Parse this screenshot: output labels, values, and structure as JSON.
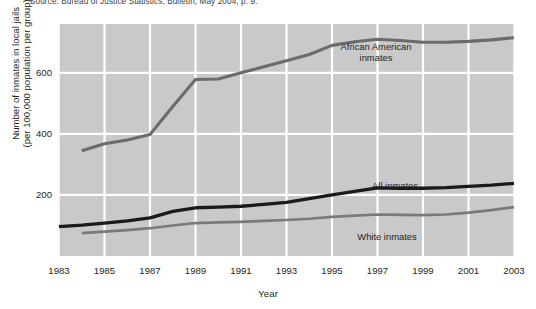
{
  "figure": {
    "source_note": "Source: Bureau of Justice Statistics, Bulletin, May 2004, p. 9.",
    "xaxis_title": "Year",
    "yaxis_title_line1": "Number of inmates in local jails",
    "yaxis_title_line2": "(per 100,000 population per group)",
    "annotations": {
      "african_american_line1": "African American",
      "african_american_line2": "inmates",
      "all_inmates": "All inmates",
      "white_inmates": "White inmates"
    }
  },
  "colors": {
    "plot_background": "#c9c9c9",
    "gridline": "#ffffff",
    "page_background": "#ffffff",
    "african_american_line": "#6b6b6b",
    "all_inmates_line": "#1a1a1a",
    "white_inmates_line": "#7a7a7a",
    "text": "#231f20"
  },
  "chart_data": {
    "type": "line",
    "title": "",
    "xlabel": "Year",
    "ylabel": "Number of inmates in local jails (per 100,000 population per group)",
    "xlim": [
      1983,
      2003
    ],
    "ylim": [
      0,
      760
    ],
    "xticks": [
      1983,
      1985,
      1987,
      1989,
      1991,
      1993,
      1995,
      1997,
      1999,
      2001,
      2003
    ],
    "yticks": [
      200,
      400,
      600
    ],
    "grid": true,
    "legend_position": "inline-annotations",
    "x": [
      1983,
      1984,
      1985,
      1986,
      1987,
      1988,
      1989,
      1990,
      1991,
      1992,
      1993,
      1994,
      1995,
      1996,
      1997,
      1998,
      1999,
      2000,
      2001,
      2002,
      2003
    ],
    "series": [
      {
        "name": "African American inmates",
        "color": "#6b6b6b",
        "values": [
          null,
          345,
          368,
          380,
          398,
          490,
          578,
          580,
          600,
          620,
          640,
          660,
          690,
          702,
          710,
          706,
          700,
          700,
          703,
          708,
          715
        ]
      },
      {
        "name": "All inmates",
        "color": "#1a1a1a",
        "values": [
          96,
          101,
          108,
          115,
          125,
          146,
          158,
          160,
          163,
          169,
          176,
          188,
          200,
          212,
          223,
          222,
          222,
          224,
          228,
          232,
          238
        ]
      },
      {
        "name": "White inmates",
        "color": "#7a7a7a",
        "values": [
          null,
          75,
          80,
          85,
          91,
          100,
          108,
          110,
          112,
          115,
          118,
          122,
          128,
          132,
          136,
          135,
          134,
          136,
          142,
          150,
          160
        ]
      }
    ]
  }
}
